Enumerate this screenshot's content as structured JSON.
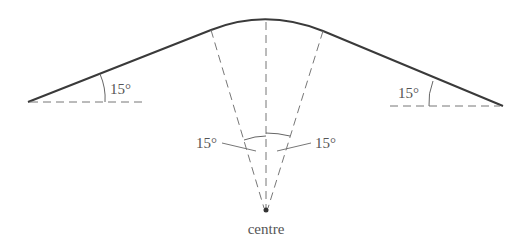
{
  "diagram": {
    "type": "geometry-figure",
    "labels": {
      "left_angle": "15°",
      "right_angle": "15°",
      "centre_left_angle": "15°",
      "centre_right_angle": "15°",
      "centre": "centre"
    },
    "angles_deg": {
      "left_slope": 15,
      "right_slope": 15,
      "centre_left_sector": 15,
      "centre_right_sector": 15
    },
    "colors": {
      "curve": "#3a3a3a",
      "dashed": "#777777",
      "text": "#555555",
      "background": "#ffffff"
    }
  }
}
